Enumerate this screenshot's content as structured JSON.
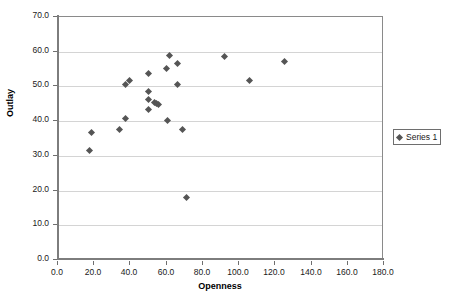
{
  "chart_data": {
    "type": "scatter",
    "title": "",
    "xlabel": "Openness",
    "ylabel": "Outlay",
    "xlim": [
      0.0,
      180.0
    ],
    "ylim": [
      0.0,
      70.0
    ],
    "xticks": [
      "0.0",
      "20.0",
      "40.0",
      "60.0",
      "80.0",
      "100.0",
      "120.0",
      "140.0",
      "160.0",
      "180.0"
    ],
    "yticks": [
      "0.0",
      "10.0",
      "20.0",
      "30.0",
      "40.0",
      "50.0",
      "60.0",
      "70.0"
    ],
    "xtick_values": [
      0,
      20,
      40,
      60,
      80,
      100,
      120,
      140,
      160,
      180
    ],
    "ytick_values": [
      0,
      10,
      20,
      30,
      40,
      50,
      60,
      70
    ],
    "grid": "horizontal",
    "legend_position": "right",
    "marker_shape": "diamond",
    "marker_color": "#555555",
    "series": [
      {
        "name": "Series 1",
        "points": [
          [
            17.5,
            31.6
          ],
          [
            18.5,
            36.7
          ],
          [
            34.0,
            37.7
          ],
          [
            37.5,
            40.9
          ],
          [
            37.5,
            50.6
          ],
          [
            39.5,
            51.8
          ],
          [
            49.8,
            53.8
          ],
          [
            49.8,
            48.5
          ],
          [
            49.8,
            46.1
          ],
          [
            50.2,
            43.3
          ],
          [
            53.5,
            45.5
          ],
          [
            54.5,
            45.2
          ],
          [
            55.3,
            44.9
          ],
          [
            59.8,
            55.1
          ],
          [
            60.2,
            40.1
          ],
          [
            61.5,
            58.9
          ],
          [
            66.0,
            56.5
          ],
          [
            66.2,
            50.6
          ],
          [
            69.0,
            37.5
          ],
          [
            71.0,
            17.9
          ],
          [
            92.0,
            58.6
          ],
          [
            106.0,
            51.6
          ],
          [
            125.0,
            57.3
          ]
        ]
      }
    ]
  },
  "legend": {
    "entries": [
      {
        "label": "Series 1"
      }
    ]
  }
}
